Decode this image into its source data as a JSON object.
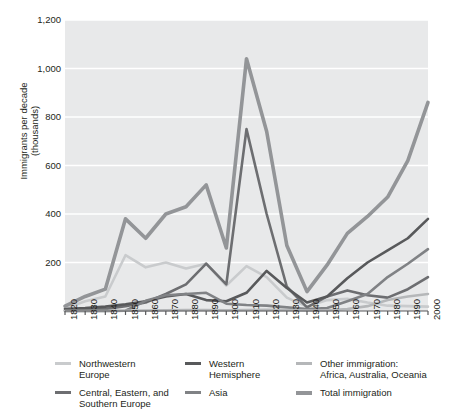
{
  "chart_data": {
    "type": "line",
    "title": "",
    "xlabel": "",
    "ylabel": "Immigrants per decade\n(thousands)",
    "x": [
      1820,
      1830,
      1840,
      1850,
      1860,
      1870,
      1880,
      1890,
      1900,
      1910,
      1920,
      1930,
      1940,
      1950,
      1960,
      1970,
      1980,
      1990,
      2000
    ],
    "xlim": [
      1820,
      2000
    ],
    "ylim": [
      0,
      1200
    ],
    "yticks": [
      0,
      200,
      400,
      600,
      800,
      1000,
      1200
    ],
    "ytick_labels": [
      "",
      "200",
      "400",
      "600",
      "800",
      "1,000",
      "1,200"
    ],
    "grid": "horizontal",
    "legend_position": "bottom",
    "series": [
      {
        "name": "Northwestern Europe",
        "color": "#c9cbcd",
        "width": 2.6,
        "values": [
          10,
          40,
          60,
          230,
          180,
          200,
          175,
          195,
          105,
          185,
          140,
          55,
          18,
          45,
          50,
          35,
          22,
          20,
          18
        ]
      },
      {
        "name": "Central, Eastern, and Southern Europe",
        "color": "#6d6e71",
        "width": 2.6,
        "values": [
          2,
          5,
          8,
          20,
          35,
          70,
          110,
          195,
          110,
          750,
          400,
          100,
          15,
          60,
          85,
          65,
          55,
          90,
          140
        ]
      },
      {
        "name": "Western Hemisphere",
        "color": "#58595b",
        "width": 2.6,
        "values": [
          8,
          12,
          18,
          28,
          40,
          60,
          70,
          45,
          40,
          75,
          165,
          95,
          35,
          60,
          135,
          200,
          250,
          300,
          380
        ]
      },
      {
        "name": "Asia",
        "color": "#808285",
        "width": 2.6,
        "values": [
          0,
          0,
          0,
          1,
          42,
          65,
          70,
          75,
          30,
          25,
          22,
          15,
          8,
          12,
          40,
          70,
          140,
          195,
          255
        ]
      },
      {
        "name": "Other immigration:\nAfrica, Australia, Oceania",
        "color": "#b5b7b9",
        "width": 2.6,
        "values": [
          0,
          0,
          0,
          1,
          2,
          3,
          4,
          4,
          3,
          4,
          5,
          4,
          2,
          3,
          8,
          20,
          45,
          60,
          70
        ]
      },
      {
        "name": "Total immigration",
        "color": "#939598",
        "width": 3.6,
        "values": [
          20,
          60,
          90,
          380,
          300,
          400,
          430,
          520,
          260,
          1040,
          740,
          270,
          80,
          190,
          320,
          390,
          470,
          620,
          860
        ]
      }
    ]
  },
  "axis": {
    "ytick_labels": [
      "1,200",
      "1,000",
      "800",
      "600",
      "400",
      "200"
    ],
    "ylabel": "Immigrants per decade\n(thousands)",
    "xtick_labels": [
      "1820",
      "1830",
      "1840",
      "1850",
      "1860",
      "1870",
      "1880",
      "1890",
      "1900",
      "1910",
      "1920",
      "1930",
      "1940",
      "1950",
      "1960",
      "1970",
      "1980",
      "1990",
      "2000"
    ]
  },
  "legend": {
    "columns": [
      {
        "entries": [
          {
            "label": "Northwestern\nEurope",
            "color": "#c9cbcd",
            "thick": false
          },
          {
            "label": "Central, Eastern, and\nSouthern Europe",
            "color": "#6d6e71",
            "thick": false
          }
        ]
      },
      {
        "entries": [
          {
            "label": "Western\nHemisphere",
            "color": "#58595b",
            "thick": false
          },
          {
            "label": "Asia",
            "color": "#808285",
            "thick": false
          }
        ]
      },
      {
        "entries": [
          {
            "label": "Other immigration:\nAfrica, Australia, Oceania",
            "color": "#b5b7b9",
            "thick": false
          },
          {
            "label": "Total immigration",
            "color": "#939598",
            "thick": true
          }
        ]
      }
    ]
  },
  "style": {
    "plot_background": "#e8e9ea",
    "gridline_color": "#ffffff",
    "axis_color": "#58595b",
    "page_background": "#ffffff"
  }
}
